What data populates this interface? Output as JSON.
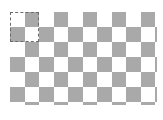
{
  "canvas": {
    "pattern": "checkerboard",
    "columns": 10,
    "rows": 6,
    "partial_column": true,
    "partial_row": true,
    "cell_width": 14.5,
    "cell_height": 15,
    "first_cell": "light",
    "colors": {
      "light": "#ffffff",
      "dark": "#a9a9a9",
      "selection_border": "#6a6a6a",
      "background": "#ffffff"
    }
  },
  "selection": {
    "style": "dashed",
    "covers_columns": 2,
    "covers_rows": 2
  }
}
